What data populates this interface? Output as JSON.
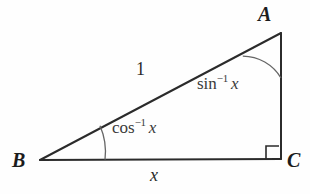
{
  "figure": {
    "type": "right-triangle-inverse-trigonometry-diagram",
    "background_color": "#fefefe",
    "stroke_color": "#2b2b2b",
    "arc_color": "#555555",
    "vertices": {
      "A": {
        "label": "A",
        "x": 281,
        "y": 33,
        "position": "top-right"
      },
      "B": {
        "label": "B",
        "x": 40,
        "y": 160,
        "position": "bottom-left"
      },
      "C": {
        "label": "C",
        "x": 281,
        "y": 159,
        "position": "bottom-right"
      }
    },
    "sides": {
      "hypotenuse": {
        "label": "1",
        "from": "B",
        "to": "A"
      },
      "base": {
        "label": "x",
        "from": "B",
        "to": "C"
      },
      "vertical": {
        "label": "",
        "from": "A",
        "to": "C"
      }
    },
    "angles": {
      "at_A": {
        "function": "sin",
        "exponent": "−1",
        "argument": "x",
        "full_label": "sin−1 x",
        "arc_radius": 45
      },
      "at_B": {
        "function": "cos",
        "exponent": "−1",
        "argument": "x",
        "full_label": "cos−1 x",
        "arc_radius": 65
      },
      "at_C": {
        "marker": "right-angle-square",
        "size": 13,
        "label": "90°"
      }
    }
  }
}
